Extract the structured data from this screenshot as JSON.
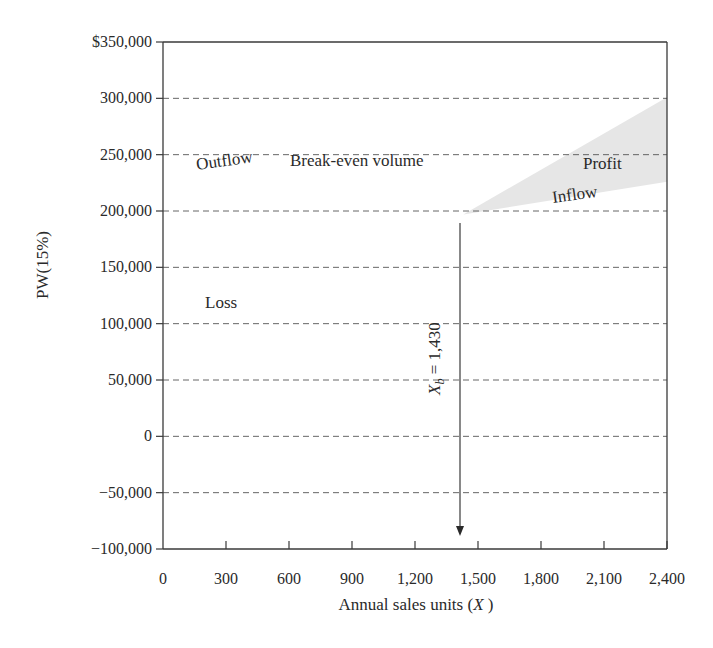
{
  "chart_data": {
    "type": "line",
    "title": "",
    "xlabel": "Annual sales units (X)",
    "xlabel_parts": {
      "prefix": "Annual sales units (",
      "var": "X",
      "suffix": " )"
    },
    "ylabel": "PW(15%)",
    "xlim": [
      0,
      2400
    ],
    "ylim": [
      -100000,
      350000
    ],
    "x_ticks": [
      0,
      300,
      600,
      900,
      1200,
      1500,
      1800,
      2100,
      2400
    ],
    "x_tick_labels": [
      "0",
      "300",
      "600",
      "900",
      "1,200",
      "1,500",
      "1,800",
      "2,100",
      "2,400"
    ],
    "y_ticks": [
      350000,
      300000,
      250000,
      200000,
      150000,
      100000,
      50000,
      0,
      -50000,
      -100000
    ],
    "y_tick_labels": [
      "$350,000",
      "300,000",
      "250,000",
      "200,000",
      "150,000",
      "100,000",
      "50,000",
      "0",
      "−50,000",
      "−100,000"
    ],
    "grid": {
      "horizontal_dashed": true,
      "vertical": false
    },
    "series": [
      {
        "name": "Inflow",
        "x": [
          1430,
          2400
        ],
        "y": [
          197000,
          301000
        ]
      },
      {
        "name": "Outflow",
        "x": [
          1430,
          2400
        ],
        "y": [
          197000,
          226000
        ]
      }
    ],
    "shaded_region": {
      "name": "Profit",
      "x_from": 1430,
      "x_to": 2400,
      "color": "#e6e6e6"
    },
    "annotations": [
      {
        "text": "Break-even volume",
        "x": 620,
        "y": 218000
      },
      {
        "text": "Outflow",
        "x": 170,
        "y": 177000,
        "rotation": -8
      },
      {
        "text": "Loss",
        "x": 200,
        "y": 112000
      },
      {
        "text": "Inflow",
        "x": 1870,
        "y": 190000,
        "rotation": -8
      },
      {
        "text": "Profit",
        "x": 2000,
        "y": 241000
      },
      {
        "text": "X_b = 1,430",
        "x": 1430,
        "y": 50000,
        "rotation": -90,
        "arrow": {
          "x": 1430,
          "from_y": 190000,
          "to_y": -90000
        }
      }
    ],
    "break_even": {
      "label_var": "X",
      "label_sub": "b",
      "label_rest": " = 1,430",
      "value": 1430
    }
  },
  "colors": {
    "axis": "#3a3a3a",
    "grid": "#555555",
    "text": "#2a2a2a",
    "profit_fill": "#e6e6e6"
  }
}
